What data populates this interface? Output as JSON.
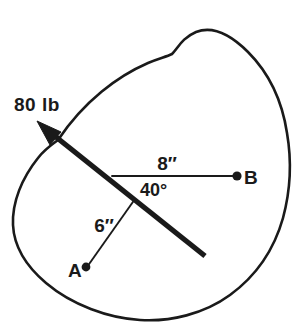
{
  "figure": {
    "stroke_color": "#1a1a1a",
    "background_color": "#ffffff",
    "labels": {
      "force": "80 lb",
      "dimension_b": "8″",
      "dimension_a": "6″",
      "angle": "40°",
      "point_a": "A",
      "point_b": "B"
    }
  }
}
